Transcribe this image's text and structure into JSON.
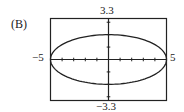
{
  "figure": {
    "choice_label": "(B)",
    "window": {
      "xmin_label": "−5",
      "xmax_label": "5",
      "ymin_label": "−3.3",
      "ymax_label": "3.3"
    },
    "colors": {
      "line": "#222222",
      "background": "#ffffff"
    }
  },
  "chart_data": {
    "type": "line",
    "title": "",
    "subtitle": "(B)",
    "xlabel": "",
    "ylabel": "",
    "xlim": [
      -5,
      5
    ],
    "ylim": [
      -3.3,
      3.3
    ],
    "x_tick_step": 1,
    "y_tick_step": 1,
    "grid": false,
    "legend": null,
    "axis_labels": {
      "left": "-5",
      "right": "5",
      "top": "3.3",
      "bottom": "-3.3"
    },
    "series": [
      {
        "name": "ellipse",
        "equation": "x^2/25 + y^2/4 = 1",
        "center": [
          0,
          0
        ],
        "semi_major_x": 5,
        "semi_minor_y": 2,
        "key_points": [
          {
            "x": -5,
            "y": 0
          },
          {
            "x": 5,
            "y": 0
          },
          {
            "x": 0,
            "y": 2
          },
          {
            "x": 0,
            "y": -2
          }
        ]
      }
    ]
  }
}
